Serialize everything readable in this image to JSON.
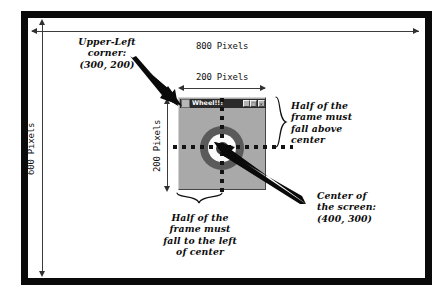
{
  "diagram": {
    "title_context": "Screen coordinate diagram showing a centered window on an 800x600 screen",
    "screen": {
      "width_label": "800 Pixels",
      "height_label": "600 Pixels"
    },
    "frame": {
      "width_label": "200 Pixels",
      "height_label": "200 Pixels"
    },
    "window": {
      "title": "Wheel!!!",
      "system_icon": "window-system-menu-icon",
      "buttons": [
        {
          "name": "minimize",
          "glyph": "_"
        },
        {
          "name": "maximize",
          "glyph": "□"
        },
        {
          "name": "close",
          "glyph": "×"
        }
      ]
    },
    "annotations": {
      "upper_left": "Upper-Left\ncorner:\n(300, 200)",
      "center": "Center of\nthe screen:\n(400, 300)",
      "above_center": "Half of the\nframe must\nfall above\ncenter",
      "left_of_center": "Half of the\nframe must\nfall to the left\nof center"
    },
    "colors": {
      "screen_border": "#0a0a0a",
      "window_face": "#a9a9a9",
      "titlebar": "#2b2b2b",
      "bullseye_outer": "#5a5a5a",
      "bullseye_mid": "#fbfbfb",
      "bullseye_core": "#3a3a3a",
      "crosshair": "#131313",
      "measure_line": "#3c3c3c"
    }
  }
}
